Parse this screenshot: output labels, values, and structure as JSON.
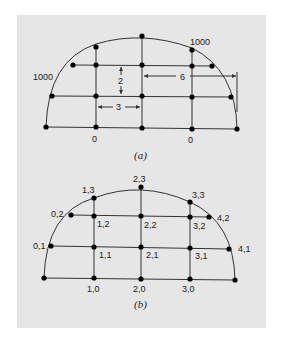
{
  "figure_a": {
    "caption": "(a)",
    "boundary_labels": {
      "left_arc": "1000",
      "right_arc": "1000",
      "bottom_left": "0",
      "bottom_right": "0"
    },
    "dimensions": {
      "vertical_spacing": "2",
      "horizontal_spacing": "3",
      "radius": "6"
    }
  },
  "figure_b": {
    "caption": "(b)",
    "node_labels": {
      "n01": "0,1",
      "n02": "0,2",
      "n10": "1,0",
      "n11": "1,1",
      "n12": "1,2",
      "n13": "1,3",
      "n20": "2,0",
      "n21": "2,1",
      "n22": "2,2",
      "n23": "2,3",
      "n30": "3,0",
      "n31": "3,1",
      "n32": "3,2",
      "n33": "3,3",
      "n41": "4,1",
      "n42": "4,2"
    }
  }
}
